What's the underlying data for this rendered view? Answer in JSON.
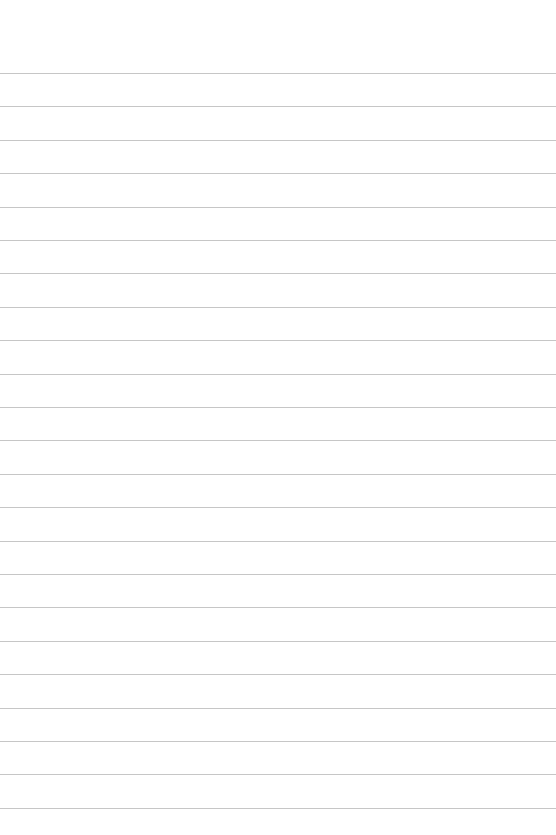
{
  "page": {
    "type": "ruled-paper",
    "background_color": "#ffffff",
    "line_color": "#c6c6c6",
    "line_count": 23,
    "first_line_y": 73,
    "line_spacing": 33.4,
    "text": []
  }
}
